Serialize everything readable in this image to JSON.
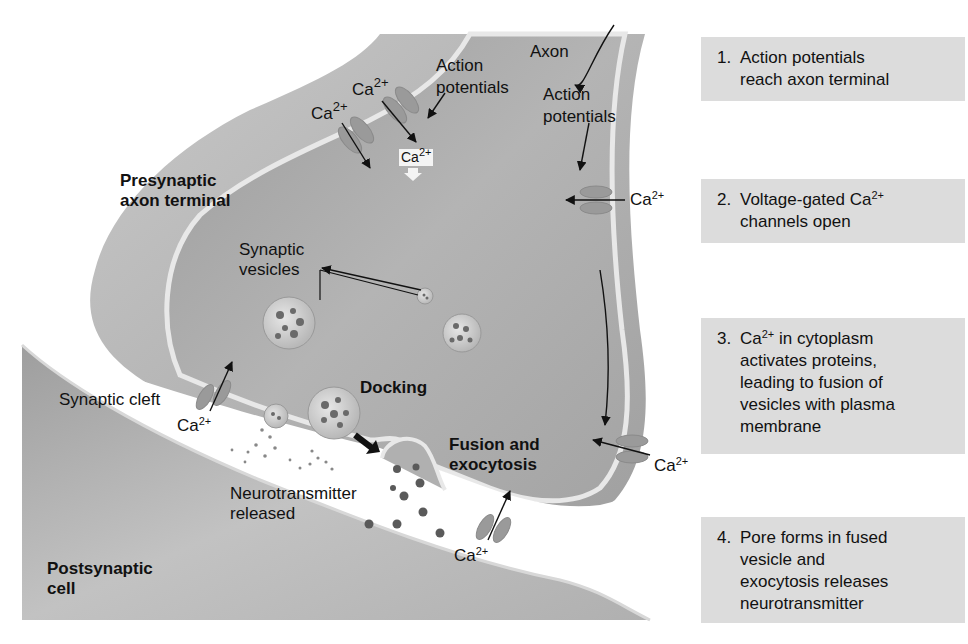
{
  "diagram": {
    "type": "labeled-illustration",
    "region_labels": {
      "presynaptic": [
        "Presynaptic",
        "axon terminal"
      ],
      "postsynaptic": [
        "Postsynaptic",
        "cell"
      ],
      "axon": "Axon",
      "synaptic_vesicles": [
        "Synaptic",
        "vesicles"
      ],
      "synaptic_cleft": "Synaptic cleft",
      "docking": "Docking",
      "fusion": [
        "Fusion and",
        "exocytosis"
      ],
      "neurotransmitter": [
        "Neurotransmitter",
        "released"
      ]
    },
    "action_potential_labels": [
      [
        "Action",
        "potentials"
      ],
      [
        "Action",
        "potentials"
      ]
    ],
    "calcium": {
      "base": "Ca",
      "charge": "2+"
    },
    "steps": [
      {
        "num": "1.",
        "text": "Action potentials\nreach axon terminal"
      },
      {
        "num": "2.",
        "text_before": "Voltage-gated Ca",
        "sup": "2+",
        "text_after": "\nchannels open"
      },
      {
        "num": "3.",
        "text_before": "Ca",
        "sup": "2+",
        "text_after": " in cytoplasm\nactivates proteins,\nleading to fusion of\nvesicles with plasma\nmembrane"
      },
      {
        "num": "4.",
        "text": "Pore forms in fused\nvesicle and\nexocytosis releases\nneurotransmitter"
      }
    ]
  },
  "colors": {
    "background": "#ffffff",
    "cell_outer": "#b4b4b4",
    "cell_inner": "#a6a6a6",
    "membrane": "#e8e8e8",
    "cleft": "#ffffff",
    "step_box": "#dcdcdc",
    "channel": "#9a9a9a",
    "neurotransmitter_dot": "#5a5a5a"
  }
}
